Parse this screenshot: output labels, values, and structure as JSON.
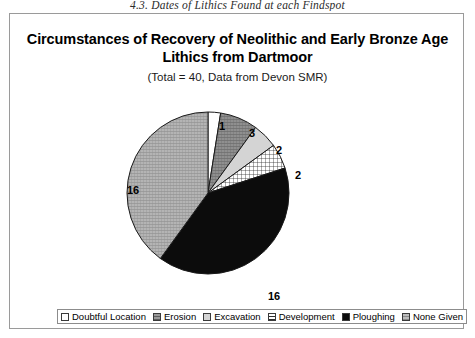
{
  "page": {
    "running_header": "4.3. Dates of Lithics Found at each Findspot"
  },
  "chart": {
    "title": "Circumstances of Recovery of Neolithic and Early Bronze Age Lithics from Dartmoor",
    "subtitle": "(Total = 40, Data from Devon SMR)"
  },
  "chart_data": {
    "type": "pie",
    "title": "Circumstances of Recovery of Neolithic and Early Bronze Age Lithics from Dartmoor",
    "subtitle": "(Total = 40, Data from Devon SMR)",
    "total": 40,
    "source": "Devon SMR",
    "start_angle_deg": 0,
    "direction": "clockwise",
    "legend_position": "bottom",
    "categories": [
      "Doubtful Location",
      "Erosion",
      "Excavation",
      "Development",
      "Ploughing",
      "None Given"
    ],
    "values": [
      1,
      3,
      2,
      2,
      16,
      16
    ],
    "labels": [
      "1",
      "3",
      "2",
      "2",
      "16",
      "16"
    ],
    "slices": [
      {
        "name": "Doubtful Location",
        "value": 1,
        "label": "1",
        "fill": "solid-white",
        "color": "#ffffff",
        "start_deg": 0,
        "end_deg": 9,
        "label_x": 209,
        "label_y": 107
      },
      {
        "name": "Erosion",
        "value": 3,
        "label": "3",
        "fill": "hatch-mid-gray",
        "color": "#8a8a8a",
        "start_deg": 9,
        "end_deg": 36,
        "label_x": 239,
        "label_y": 114
      },
      {
        "name": "Excavation",
        "value": 2,
        "label": "2",
        "fill": "solid-light-gray",
        "color": "#d2d2d2",
        "start_deg": 36,
        "end_deg": 54,
        "label_x": 266,
        "label_y": 131
      },
      {
        "name": "Development",
        "value": 2,
        "label": "2",
        "fill": "grid-crosshatch",
        "color": "#ffffff",
        "start_deg": 54,
        "end_deg": 72,
        "label_x": 285,
        "label_y": 156
      },
      {
        "name": "Ploughing",
        "value": 16,
        "label": "16",
        "fill": "solid-black",
        "color": "#0a0a0a",
        "start_deg": 72,
        "end_deg": 216,
        "label_x": 258,
        "label_y": 277
      },
      {
        "name": "None Given",
        "value": 16,
        "label": "16",
        "fill": "hatch-light-gray",
        "color": "#a8a8a8",
        "start_deg": 216,
        "end_deg": 360,
        "label_x": 117,
        "label_y": 171
      }
    ]
  },
  "legend": {
    "items": [
      {
        "label": "Doubtful Location",
        "swatch": "solid-white"
      },
      {
        "label": "Erosion",
        "swatch": "hatch-mid-gray"
      },
      {
        "label": "Excavation",
        "swatch": "solid-light-gray"
      },
      {
        "label": "Development",
        "swatch": "grid-crosshatch"
      },
      {
        "label": "Ploughing",
        "swatch": "solid-black"
      },
      {
        "label": "None Given",
        "swatch": "hatch-light-gray"
      }
    ]
  }
}
